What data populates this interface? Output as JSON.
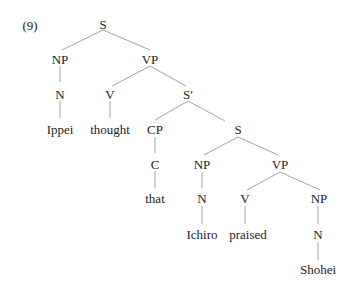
{
  "example_number": "(9)",
  "colors": {
    "text": "#222222",
    "edge": "#8a8a8a",
    "background": "#ffffff"
  },
  "nodes": {
    "S_root": "S",
    "NP_subj": "NP",
    "N_subj": "N",
    "Ippei": "Ippei",
    "VP_main": "VP",
    "V_main": "V",
    "thought": "thought",
    "Sbar": "S′",
    "CP": "CP",
    "C": "C",
    "that": "that",
    "S_emb": "S",
    "NP_emb": "NP",
    "N_emb": "N",
    "Ichiro": "Ichiro",
    "VP_emb": "VP",
    "V_emb": "V",
    "praised": "praised",
    "NP_obj": "NP",
    "N_obj": "N",
    "Shohei": "Shohei"
  }
}
